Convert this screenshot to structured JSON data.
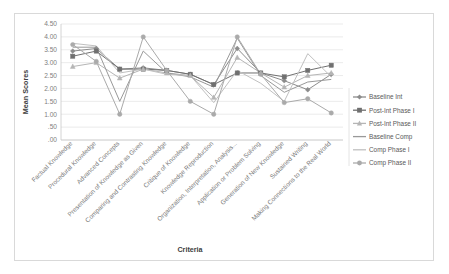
{
  "chart_data": {
    "type": "line",
    "title": "",
    "xlabel": "Criteria",
    "ylabel": "Mean Scores",
    "ylim": [
      0,
      4.5
    ],
    "ytick_step": 0.5,
    "ytick_labels": [
      "4.50",
      "4.00",
      "3.50",
      "3.00",
      "2.50",
      "2.00",
      "1.50",
      "1.00",
      ".50",
      ".00"
    ],
    "grid": true,
    "legend_position": "right",
    "categories": [
      "Factual Knowledge",
      "Procedural Knowledge",
      "Advanced Concepts",
      "Presentation of Knowledge as Given",
      "Comparing and Contrasting Knowledge",
      "Critique of Knowledge",
      "Knowledge Reproduction",
      "Organization, Interpretation, Analysis...",
      "Application or Problem Solving",
      "Generation of New Knowledge",
      "Sustained Writing",
      "Making Connections to the Real World"
    ],
    "series": [
      {
        "name": "Baseline Int",
        "color": "#8c8c8c",
        "marker": "diamond",
        "values": [
          3.45,
          3.55,
          2.75,
          2.8,
          2.7,
          2.55,
          2.15,
          3.55,
          2.6,
          2.3,
          1.95,
          2.55
        ]
      },
      {
        "name": "Post-Int Phase I",
        "color": "#707070",
        "marker": "square",
        "values": [
          3.25,
          3.45,
          2.75,
          2.75,
          2.7,
          2.55,
          2.15,
          2.6,
          2.6,
          2.45,
          2.7,
          2.9
        ]
      },
      {
        "name": "Post-Int Phase II",
        "color": "#b5b5b5",
        "marker": "triangle",
        "values": [
          2.85,
          3.0,
          2.4,
          2.75,
          2.6,
          2.5,
          1.65,
          3.2,
          2.6,
          2.05,
          2.5,
          2.6
        ]
      },
      {
        "name": "Baseline Comp",
        "color": "#999999",
        "marker": "none",
        "values": [
          3.6,
          3.6,
          1.5,
          3.45,
          2.6,
          2.45,
          2.05,
          3.95,
          2.5,
          1.85,
          2.25,
          2.35
        ]
      },
      {
        "name": "Comp Phase I",
        "color": "#c0c0c0",
        "marker": "none",
        "values": [
          3.75,
          3.65,
          2.6,
          2.75,
          2.55,
          2.5,
          1.45,
          2.7,
          2.2,
          1.5,
          3.35,
          2.45
        ]
      },
      {
        "name": "Comp Phase II",
        "color": "#aaaaaa",
        "marker": "circle",
        "values": [
          3.7,
          3.05,
          1.0,
          4.0,
          2.7,
          1.5,
          1.0,
          4.0,
          2.55,
          1.45,
          1.6,
          1.05
        ]
      }
    ]
  },
  "legend": {
    "entries": [
      "Baseline Int",
      "Post-Int Phase I",
      "Post-Int Phase II",
      "Baseline Comp",
      "Comp Phase I",
      "Comp Phase II"
    ]
  }
}
